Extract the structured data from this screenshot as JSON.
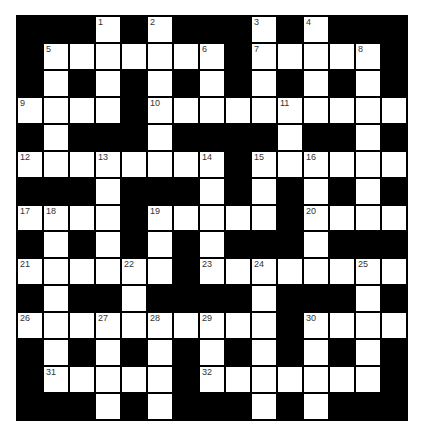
{
  "puzzle": {
    "rows": 15,
    "cols": 15,
    "colors": {
      "block": "#000000",
      "cell": "#ffffff",
      "number": "#333333"
    },
    "grid": [
      "###.#.###.#.###",
      "#.......#.....#",
      "#.#.#.#.#.#.#.#",
      "....#..........",
      "#.###.####.##.#",
      "........#......",
      "###.###.#.#.#.#",
      "....#.....#....",
      "#.#.#.#.###.###",
      "......#........",
      "#.##.####.###.#",
      "..........#....",
      "#.#.#.#.#.#.#.#",
      "#.....#.......#",
      "###.#.###.#.###"
    ],
    "numbers": [
      {
        "n": "1",
        "r": 0,
        "c": 3
      },
      {
        "n": "2",
        "r": 0,
        "c": 5
      },
      {
        "n": "3",
        "r": 0,
        "c": 9
      },
      {
        "n": "4",
        "r": 0,
        "c": 11
      },
      {
        "n": "5",
        "r": 1,
        "c": 1
      },
      {
        "n": "6",
        "r": 1,
        "c": 7
      },
      {
        "n": "7",
        "r": 1,
        "c": 9
      },
      {
        "n": "8",
        "r": 1,
        "c": 13
      },
      {
        "n": "9",
        "r": 3,
        "c": 0
      },
      {
        "n": "10",
        "r": 3,
        "c": 5
      },
      {
        "n": "11",
        "r": 3,
        "c": 10
      },
      {
        "n": "12",
        "r": 5,
        "c": 0
      },
      {
        "n": "13",
        "r": 5,
        "c": 3
      },
      {
        "n": "14",
        "r": 5,
        "c": 7
      },
      {
        "n": "15",
        "r": 5,
        "c": 9
      },
      {
        "n": "16",
        "r": 5,
        "c": 11
      },
      {
        "n": "17",
        "r": 7,
        "c": 0
      },
      {
        "n": "18",
        "r": 7,
        "c": 1
      },
      {
        "n": "19",
        "r": 7,
        "c": 5
      },
      {
        "n": "20",
        "r": 7,
        "c": 11
      },
      {
        "n": "21",
        "r": 9,
        "c": 0
      },
      {
        "n": "22",
        "r": 9,
        "c": 4
      },
      {
        "n": "23",
        "r": 9,
        "c": 7
      },
      {
        "n": "24",
        "r": 9,
        "c": 9
      },
      {
        "n": "25",
        "r": 9,
        "c": 13
      },
      {
        "n": "26",
        "r": 11,
        "c": 0
      },
      {
        "n": "27",
        "r": 11,
        "c": 3
      },
      {
        "n": "28",
        "r": 11,
        "c": 5
      },
      {
        "n": "29",
        "r": 11,
        "c": 7
      },
      {
        "n": "30",
        "r": 11,
        "c": 11
      },
      {
        "n": "31",
        "r": 13,
        "c": 1
      },
      {
        "n": "32",
        "r": 13,
        "c": 7
      }
    ]
  }
}
